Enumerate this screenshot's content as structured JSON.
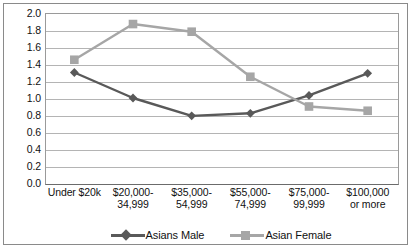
{
  "chart_data": {
    "type": "line",
    "title": "",
    "xlabel": "",
    "ylabel": "",
    "ylim": [
      0.0,
      2.0
    ],
    "ytick_step": 0.2,
    "grid": true,
    "legend_position": "bottom",
    "categories": [
      "Under $20k",
      "$20,000-34,999",
      "$35,000-54,999",
      "$55,000-74,999",
      "$75,000-99,999",
      "$100,000 or more"
    ],
    "category_lines": [
      [
        "Under $20k"
      ],
      [
        "$20,000-",
        "34,999"
      ],
      [
        "$35,000-",
        "54,999"
      ],
      [
        "$55,000-",
        "74,999"
      ],
      [
        "$75,000-",
        "99,999"
      ],
      [
        "$100,000",
        "or more"
      ]
    ],
    "ytick_labels": [
      "2.0",
      "1.8",
      "1.6",
      "1.4",
      "1.2",
      "1.0",
      "0.8",
      "0.6",
      "0.4",
      "0.2",
      "0.0"
    ],
    "ytick_values": [
      2.0,
      1.8,
      1.6,
      1.4,
      1.2,
      1.0,
      0.8,
      0.6,
      0.4,
      0.2,
      0.0
    ],
    "series": [
      {
        "name": "Asians Male",
        "color": "#595959",
        "marker": "diamond",
        "values": [
          1.3,
          1.0,
          0.79,
          0.82,
          1.03,
          1.29
        ]
      },
      {
        "name": "Asian Female",
        "color": "#a6a6a6",
        "marker": "square",
        "values": [
          1.45,
          1.87,
          1.78,
          1.25,
          0.9,
          0.85
        ]
      }
    ]
  },
  "legend": {
    "items": [
      {
        "label": "Asians Male",
        "marker": "diamond",
        "color": "#595959"
      },
      {
        "label": "Asian Female",
        "marker": "square",
        "color": "#a6a6a6"
      }
    ]
  },
  "colors": {
    "male_line": "#595959",
    "female_line": "#a6a6a6",
    "gridline": "#b4b4b4",
    "axis": "#6b6b6b",
    "frame_border": "#8a8a8a",
    "text": "#111111",
    "background": "#ffffff"
  }
}
